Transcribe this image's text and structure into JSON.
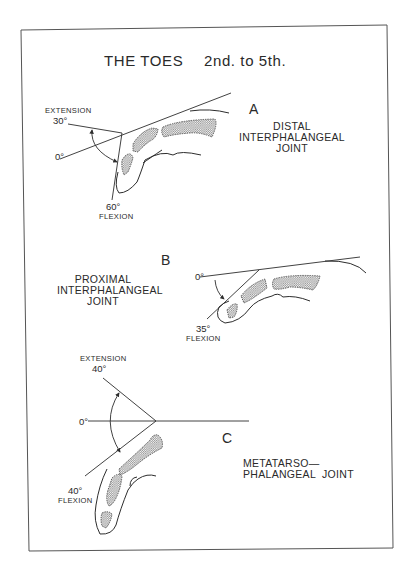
{
  "title": {
    "main": "THE TOES",
    "sub": "2nd. to 5th."
  },
  "panels": [
    {
      "letter": "A",
      "joint_lines": [
        "DISTAL",
        "INTERPHALANGEAL",
        "JOINT"
      ],
      "zero_label": "0°",
      "extension": {
        "label": "EXTENSION",
        "degrees": "30°"
      },
      "flexion": {
        "label": "FLEXION",
        "degrees": "60°"
      }
    },
    {
      "letter": "B",
      "joint_lines": [
        "PROXIMAL",
        "INTERPHALANGEAL",
        "JOINT"
      ],
      "zero_label": "0°",
      "flexion": {
        "label": "FLEXION",
        "degrees": "35°"
      }
    },
    {
      "letter": "C",
      "joint_lines": [
        "METATARSO—",
        "PHALANGEAL  JOINT"
      ],
      "zero_label": "0°",
      "extension": {
        "label": "EXTENSION",
        "degrees": "40°"
      },
      "flexion": {
        "label": "FLEXION",
        "degrees": "40°"
      }
    }
  ],
  "colors": {
    "ink": "#2d2d2d",
    "paper": "#ffffff",
    "frame": "#555555"
  }
}
